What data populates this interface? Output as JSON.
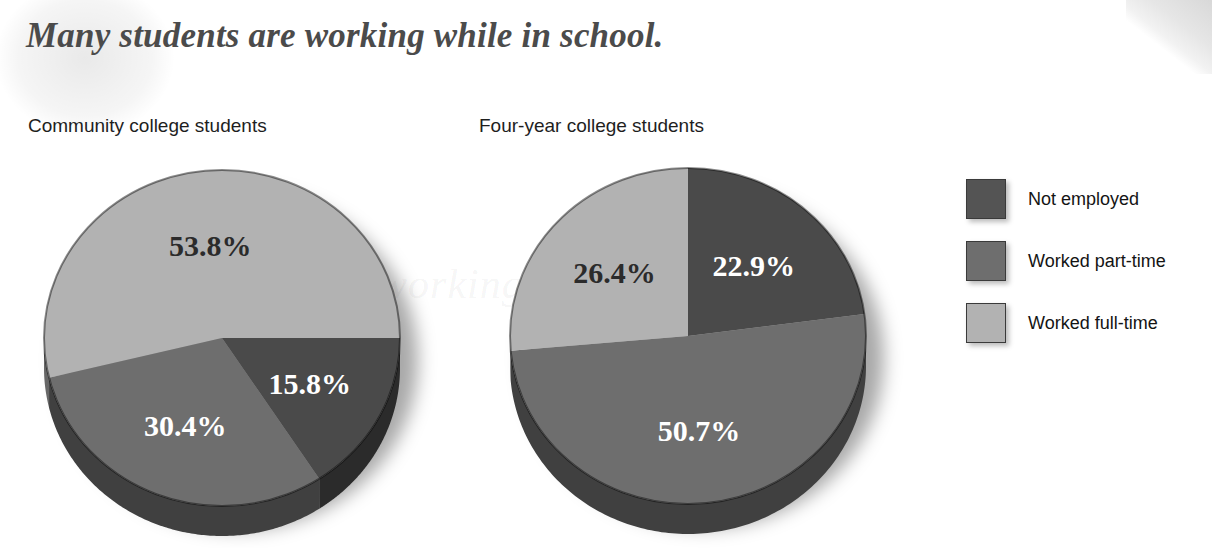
{
  "title": "Many students are working while in school.",
  "watermark": "working students",
  "legend": {
    "items": [
      {
        "label": "Not employed",
        "color": "#545454"
      },
      {
        "label": "Worked part-time",
        "color": "#6e6e6e"
      },
      {
        "label": "Worked full-time",
        "color": "#b2b2b2"
      }
    ]
  },
  "chart_data": [
    {
      "type": "pie",
      "title": "Community college students",
      "categories": [
        "Worked full-time",
        "Worked part-time",
        "Not employed"
      ],
      "values": [
        53.8,
        30.4,
        15.8
      ],
      "labels": [
        "53.8%",
        "30.4%",
        "15.8%"
      ],
      "colors": [
        "#b2b2b2",
        "#6e6e6e",
        "#4a4a4a"
      ],
      "label_colors": [
        "dark",
        "light",
        "light"
      ],
      "start_angle_deg": 0,
      "direction": "counterclockwise",
      "three_d": true
    },
    {
      "type": "pie",
      "title": "Four-year college students",
      "categories": [
        "Not employed",
        "Worked part-time",
        "Worked full-time"
      ],
      "values": [
        22.9,
        50.7,
        26.4
      ],
      "labels": [
        "22.9%",
        "50.7%",
        "26.4%"
      ],
      "colors": [
        "#4a4a4a",
        "#6e6e6e",
        "#b2b2b2"
      ],
      "label_colors": [
        "light",
        "light",
        "dark"
      ],
      "start_angle_deg": 90,
      "direction": "clockwise",
      "three_d": true
    }
  ]
}
